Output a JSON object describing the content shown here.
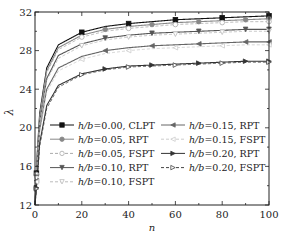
{
  "chart_data": {
    "type": "line",
    "title": "",
    "xlabel": "n",
    "ylabel": "λ",
    "xlim": [
      0,
      100
    ],
    "ylim": [
      12,
      32
    ],
    "xticks": [
      0,
      20,
      40,
      60,
      80,
      100
    ],
    "yticks": [
      12,
      16,
      20,
      24,
      28,
      32
    ],
    "grid": false,
    "legend_position": "lower center (two columns)",
    "x": [
      0,
      1,
      2,
      5,
      10,
      20,
      30,
      40,
      50,
      60,
      70,
      80,
      90,
      100
    ],
    "series": [
      {
        "name": "h/b=0.00, CLPT",
        "style": "solid",
        "marker": "filled-square",
        "color": "#111111",
        "values": [
          12.0,
          17.5,
          21.5,
          26.2,
          28.6,
          29.9,
          30.5,
          30.8,
          31.0,
          31.2,
          31.3,
          31.4,
          31.5,
          31.6
        ]
      },
      {
        "name": "h/b=0.05, RPT",
        "style": "solid",
        "marker": "filled-circle",
        "color": "#888888",
        "values": [
          12.0,
          17.3,
          21.2,
          25.9,
          28.3,
          29.6,
          30.2,
          30.5,
          30.7,
          30.9,
          31.0,
          31.1,
          31.2,
          31.3
        ]
      },
      {
        "name": "h/b=0.05, FSPT",
        "style": "dashed",
        "marker": "open-circle",
        "color": "#aaaaaa",
        "values": [
          12.0,
          17.2,
          21.0,
          25.7,
          28.1,
          29.4,
          30.0,
          30.3,
          30.5,
          30.7,
          30.8,
          30.9,
          31.0,
          31.0
        ]
      },
      {
        "name": "h/b=0.10, RPT",
        "style": "solid",
        "marker": "filled-triangle-down",
        "color": "#555555",
        "values": [
          12.0,
          16.8,
          20.6,
          25.1,
          27.5,
          28.7,
          29.3,
          29.6,
          29.8,
          29.9,
          30.0,
          30.1,
          30.2,
          30.2
        ]
      },
      {
        "name": "h/b=0.10, FSPT",
        "style": "dashed",
        "marker": "open-triangle-down",
        "color": "#bbbbbb",
        "values": [
          12.0,
          16.6,
          20.4,
          24.9,
          27.2,
          28.5,
          29.1,
          29.4,
          29.6,
          29.7,
          29.8,
          29.9,
          30.0,
          30.0
        ]
      },
      {
        "name": "h/b=0.15, RPT",
        "style": "solid",
        "marker": "filled-triangle-left",
        "color": "#666666",
        "values": [
          12.0,
          16.2,
          19.8,
          24.0,
          26.2,
          27.4,
          28.0,
          28.3,
          28.5,
          28.6,
          28.7,
          28.8,
          28.9,
          28.9
        ]
      },
      {
        "name": "h/b=0.15, FSPT",
        "style": "dashed",
        "marker": "open-triangle-left",
        "color": "#cccccc",
        "values": [
          12.0,
          16.0,
          19.5,
          23.7,
          25.9,
          27.1,
          27.7,
          28.0,
          28.2,
          28.3,
          28.4,
          28.5,
          28.6,
          28.6
        ]
      },
      {
        "name": "h/b=0.20, RPT",
        "style": "solid",
        "marker": "filled-triangle-right",
        "color": "#333333",
        "values": [
          12.0,
          15.0,
          18.4,
          22.3,
          24.4,
          25.6,
          26.1,
          26.4,
          26.5,
          26.6,
          26.7,
          26.8,
          26.9,
          26.9
        ]
      },
      {
        "name": "h/b=0.20, FSPT",
        "style": "dashed",
        "marker": "open-triangle-right",
        "color": "#444444",
        "values": [
          12.0,
          14.8,
          18.1,
          22.0,
          24.2,
          25.5,
          26.0,
          26.3,
          26.4,
          26.5,
          26.6,
          26.7,
          26.8,
          26.8
        ]
      }
    ]
  },
  "legend": {
    "col1": [
      "h/b=0.00, CLPT",
      "h/b=0.05, RPT",
      "h/b=0.05, FSPT",
      "h/b=0.10, RPT",
      "h/b=0.10, FSPT"
    ],
    "col2": [
      "h/b=0.15, RPT",
      "h/b=0.15, FSPT",
      "h/b=0.20, RPT",
      "h/b=0.20, FSPT"
    ]
  },
  "axes": {
    "xlabel": "n",
    "ylabel": "λ",
    "xtick_labels": [
      "0",
      "20",
      "40",
      "60",
      "80",
      "100"
    ],
    "ytick_labels": [
      "12",
      "16",
      "20",
      "24",
      "28",
      "32"
    ]
  }
}
